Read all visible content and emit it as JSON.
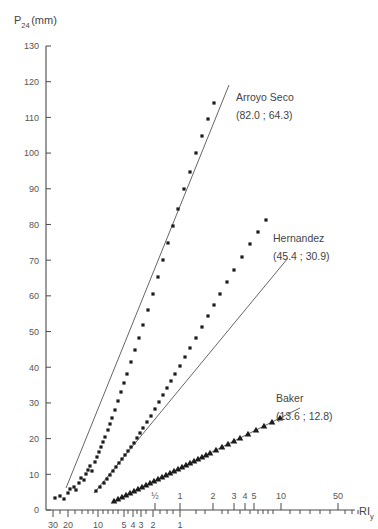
{
  "chart_data": {
    "type": "scatter",
    "title": "",
    "ylabel": "P",
    "ylabel_sub": "24",
    "ylabel_unit": "(mm)",
    "xlabel": "RI",
    "xlabel_sub": "y",
    "ylim": [
      0,
      130
    ],
    "ytick_labels": [
      "0",
      "10",
      "20",
      "30",
      "40",
      "50",
      "60",
      "70",
      "80",
      "90",
      "100",
      "110",
      "120",
      "130"
    ],
    "ytick_values": [
      0,
      10,
      20,
      30,
      40,
      50,
      60,
      70,
      80,
      90,
      100,
      110,
      120,
      130
    ],
    "grid": false,
    "legend_position": "inline-annotations",
    "xaxis_note": "Double reciprocal / Gumbel return-period scale with two label rows",
    "xtick_labels_upper": [
      "½",
      "1",
      "2",
      "3",
      "4",
      "5",
      "10",
      "50"
    ],
    "xtick_upper_px": [
      155,
      180,
      213,
      234,
      245,
      254,
      281,
      338
    ],
    "xtick_labels_lower": [
      "30",
      "20",
      "10",
      "5",
      "4",
      "3",
      "2",
      "1"
    ],
    "xtick_lower_px": [
      53,
      68,
      98,
      124,
      133,
      141,
      153,
      180
    ],
    "xtick_minor_px": [
      60,
      75,
      82,
      88,
      93,
      103,
      108,
      113,
      118,
      128,
      137,
      146,
      160,
      167,
      173,
      196,
      205,
      222,
      228,
      240,
      250,
      258,
      263,
      268,
      273,
      290,
      300,
      310,
      320,
      330,
      345,
      352,
      358
    ],
    "series": [
      {
        "name": "Arroyo Seco",
        "annotation": "(82.0 ; 64.3)",
        "param_a": "82.0",
        "param_b": "64.3",
        "marker": "square",
        "label_px": [
          236,
          101
        ],
        "annot_px": [
          236,
          119
        ],
        "fit_line_px": [
          [
            66,
            488
          ],
          [
            229,
            85
          ]
        ],
        "points_px": [
          [
            55,
            498
          ],
          [
            60,
            496
          ],
          [
            64,
            499
          ],
          [
            68,
            493
          ],
          [
            70,
            489
          ],
          [
            74,
            487
          ],
          [
            76,
            490
          ],
          [
            79,
            483
          ],
          [
            81,
            478
          ],
          [
            84,
            480
          ],
          [
            86,
            474
          ],
          [
            88,
            470
          ],
          [
            90,
            466
          ],
          [
            92,
            471
          ],
          [
            95,
            462
          ],
          [
            97,
            457
          ],
          [
            99,
            452
          ],
          [
            101,
            447
          ],
          [
            103,
            442
          ],
          [
            105,
            437
          ],
          [
            108,
            430
          ],
          [
            110,
            424
          ],
          [
            112,
            418
          ],
          [
            115,
            410
          ],
          [
            118,
            401
          ],
          [
            121,
            392
          ],
          [
            124,
            383
          ],
          [
            127,
            374
          ],
          [
            131,
            362
          ],
          [
            135,
            350
          ],
          [
            139,
            338
          ],
          [
            143,
            325
          ],
          [
            148,
            310
          ],
          [
            153,
            294
          ],
          [
            158,
            277
          ],
          [
            163,
            260
          ],
          [
            168,
            243
          ],
          [
            173,
            226
          ],
          [
            178,
            209
          ],
          [
            184,
            189
          ],
          [
            190,
            172
          ],
          [
            196,
            153
          ],
          [
            202,
            136
          ],
          [
            208,
            119
          ],
          [
            214,
            103
          ]
        ]
      },
      {
        "name": "Hernandez",
        "annotation": "(45.4 ; 30.9)",
        "param_a": "45.4",
        "param_b": "30.9",
        "marker": "square",
        "label_px": [
          273,
          242
        ],
        "annot_px": [
          273,
          260
        ],
        "fit_line_px": [
          [
            94,
            493
          ],
          [
            288,
            258
          ]
        ],
        "points_px": [
          [
            96,
            491
          ],
          [
            100,
            487
          ],
          [
            104,
            483
          ],
          [
            107,
            479
          ],
          [
            110,
            475
          ],
          [
            113,
            471
          ],
          [
            116,
            467
          ],
          [
            119,
            463
          ],
          [
            122,
            459
          ],
          [
            125,
            455
          ],
          [
            128,
            451
          ],
          [
            131,
            447
          ],
          [
            134,
            443
          ],
          [
            137,
            438
          ],
          [
            140,
            433
          ],
          [
            143,
            428
          ],
          [
            147,
            422
          ],
          [
            151,
            416
          ],
          [
            155,
            409
          ],
          [
            159,
            402
          ],
          [
            163,
            395
          ],
          [
            167,
            388
          ],
          [
            171,
            381
          ],
          [
            175,
            374
          ],
          [
            180,
            366
          ],
          [
            185,
            357
          ],
          [
            190,
            348
          ],
          [
            196,
            338
          ],
          [
            202,
            327
          ],
          [
            208,
            316
          ],
          [
            214,
            305
          ],
          [
            220,
            294
          ],
          [
            227,
            282
          ],
          [
            234,
            270
          ],
          [
            242,
            257
          ],
          [
            250,
            244
          ],
          [
            258,
            232
          ],
          [
            266,
            220
          ]
        ]
      },
      {
        "name": "Baker",
        "annotation": "(13.6 ; 12.8)",
        "param_a": "13.6",
        "param_b": "12.8",
        "marker": "triangle",
        "label_px": [
          276,
          402
        ],
        "annot_px": [
          276,
          420
        ],
        "fit_line_px": [
          [
            112,
            502
          ],
          [
            300,
            408
          ]
        ],
        "points_px": [
          [
            114,
            501
          ],
          [
            118,
            499
          ],
          [
            122,
            497
          ],
          [
            126,
            495
          ],
          [
            130,
            493
          ],
          [
            134,
            491
          ],
          [
            138,
            489
          ],
          [
            142,
            487
          ],
          [
            146,
            485
          ],
          [
            150,
            483
          ],
          [
            154,
            481
          ],
          [
            158,
            479
          ],
          [
            162,
            477
          ],
          [
            166,
            475
          ],
          [
            170,
            473
          ],
          [
            174,
            471
          ],
          [
            178,
            469
          ],
          [
            182,
            467
          ],
          [
            186,
            465
          ],
          [
            190,
            463
          ],
          [
            194,
            461
          ],
          [
            198,
            459
          ],
          [
            202,
            457
          ],
          [
            206,
            455
          ],
          [
            210,
            453
          ],
          [
            216,
            450
          ],
          [
            222,
            447
          ],
          [
            228,
            444
          ],
          [
            234,
            441
          ],
          [
            240,
            438
          ],
          [
            248,
            434
          ],
          [
            256,
            430
          ],
          [
            264,
            426
          ],
          [
            272,
            422
          ],
          [
            280,
            418
          ]
        ]
      }
    ]
  },
  "geometry": {
    "axis_x_px": 46,
    "axis_y0_px": 510,
    "axis_ytop_px": 46,
    "x_axis_right_px": 355,
    "upper_tick_row_px": 500,
    "lower_tick_row_px": 510
  }
}
